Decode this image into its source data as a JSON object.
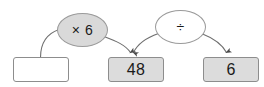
{
  "diagram": {
    "type": "function-machine",
    "background_color": "#ffffff",
    "boxes": [
      {
        "id": "input-box",
        "value": "",
        "filled": false,
        "fill_color": "#ffffff",
        "border_color": "#8d8d8d"
      },
      {
        "id": "middle-box",
        "value": "48",
        "filled": true,
        "fill_color": "#dcdcdc",
        "border_color": "#8d8d8d"
      },
      {
        "id": "output-box",
        "value": "6",
        "filled": true,
        "fill_color": "#dcdcdc",
        "border_color": "#8d8d8d"
      }
    ],
    "operations": [
      {
        "id": "multiply-op",
        "symbol": "× 6",
        "icon": "multiply-icon",
        "filled": true,
        "fill_color": "#d9d9d9",
        "border_color": "#9a9a9a"
      },
      {
        "id": "divide-op",
        "symbol": "÷",
        "icon": "divide-icon",
        "filled": false,
        "fill_color": "#ffffff",
        "border_color": "#9a9a9a"
      }
    ],
    "arrows": [
      {
        "id": "arrow-input-to-multiply",
        "from": "input-box",
        "to": "multiply-op",
        "arrowhead": false
      },
      {
        "id": "arrow-multiply-to-middle",
        "from": "multiply-op",
        "to": "middle-box",
        "arrowhead": true
      },
      {
        "id": "arrow-divide-to-middle",
        "from": "divide-op",
        "to": "middle-box",
        "arrowhead": true
      },
      {
        "id": "arrow-divide-to-output",
        "from": "divide-op",
        "to": "output-box",
        "arrowhead": true
      }
    ],
    "stroke_color": "#6f6f6f"
  }
}
